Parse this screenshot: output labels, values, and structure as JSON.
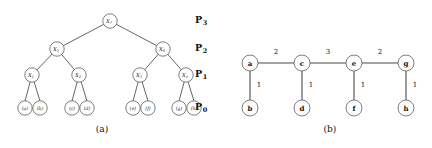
{
  "figure": {
    "panels": [
      {
        "id": "a",
        "caption": "(a)",
        "type": "hierarchy-tree",
        "level_labels": [
          {
            "base": "P",
            "sub": "3"
          },
          {
            "base": "P",
            "sub": "2"
          },
          {
            "base": "P",
            "sub": "1"
          },
          {
            "base": "P",
            "sub": "0"
          }
        ],
        "nodes": {
          "root": {
            "base": "X",
            "sub": "7"
          },
          "level2": [
            {
              "base": "X",
              "sub": "5"
            },
            {
              "base": "X",
              "sub": "6"
            }
          ],
          "level1": [
            {
              "base": "X",
              "sub": "1"
            },
            {
              "base": "X",
              "sub": "2"
            },
            {
              "base": "X",
              "sub": "3"
            },
            {
              "base": "X",
              "sub": "4"
            }
          ],
          "leaves": [
            "(a)",
            "(b)",
            "(c)",
            "(d)",
            "(e)",
            "(f)",
            "(g)",
            "(h)"
          ]
        }
      },
      {
        "id": "b",
        "caption": "(b)",
        "type": "weighted-graph",
        "top_nodes": [
          "a",
          "c",
          "e",
          "g"
        ],
        "bottom_nodes": [
          "b",
          "d",
          "f",
          "h"
        ],
        "horizontal_weights": [
          "2",
          "3",
          "2"
        ],
        "vertical_weights": [
          "1",
          "1",
          "1",
          "1"
        ]
      }
    ]
  },
  "colors": {
    "stroke": "#4a4a4a",
    "node_stroke": "#5d5d5d",
    "text": "#111111",
    "background": "#ffffff"
  }
}
